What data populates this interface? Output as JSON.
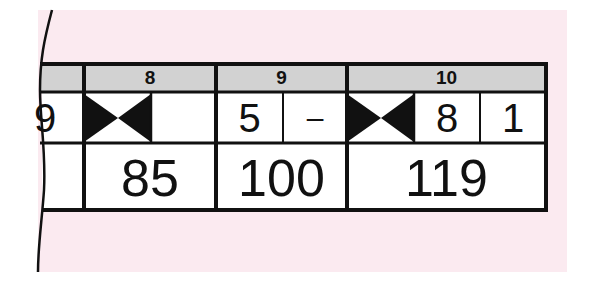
{
  "colors": {
    "background": "#fbeaf0",
    "header_fill": "#d2d2d2",
    "line": "#111111"
  },
  "frames": [
    {
      "number": "",
      "balls": [
        "9"
      ],
      "score": ""
    },
    {
      "number": "8",
      "balls": [
        "strike"
      ],
      "score": "85"
    },
    {
      "number": "9",
      "balls": [
        "5",
        "–"
      ],
      "score": "100"
    },
    {
      "number": "10",
      "balls": [
        "strike",
        "8",
        "1"
      ],
      "score": "119"
    }
  ]
}
